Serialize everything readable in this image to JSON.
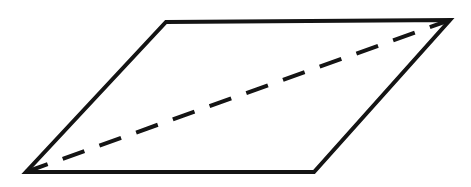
{
  "figure": {
    "type": "geometric-line-drawing",
    "canvas": {
      "width": 471,
      "height": 187,
      "background_color": "#ffffff"
    },
    "colors": {
      "stroke": "#141414",
      "fill": "#ffffff",
      "background": "#ffffff"
    },
    "shapes": {
      "plane": {
        "name": "parallelogram",
        "shape_kind": "polygon",
        "closed": true,
        "stroke_color": "#141414",
        "stroke_width": 4,
        "fill_color": "#ffffff",
        "vertices": [
          {
            "label": "top-left",
            "x": 166,
            "y": 22
          },
          {
            "label": "top-right",
            "x": 450,
            "y": 20
          },
          {
            "label": "bottom-right",
            "x": 314,
            "y": 172
          },
          {
            "label": "bottom-left",
            "x": 26,
            "y": 172
          }
        ],
        "points_attr": "166,22 450,20 314,172 26,172",
        "edges": [
          {
            "label": "top-edge",
            "from": "top-left",
            "to": "top-right"
          },
          {
            "label": "right-edge",
            "from": "top-right",
            "to": "bottom-right"
          },
          {
            "label": "bottom-edge",
            "from": "bottom-right",
            "to": "bottom-left"
          },
          {
            "label": "left-edge",
            "from": "bottom-left",
            "to": "top-left"
          }
        ]
      },
      "diagonal": {
        "name": "dashed-diagonal",
        "shape_kind": "line",
        "stroke_color": "#141414",
        "stroke_width": 4,
        "dash_length": 23,
        "gap_length": 16,
        "dash_array": "23 16",
        "from": {
          "label": "bottom-left",
          "x": 26,
          "y": 172
        },
        "to": {
          "label": "top-right",
          "x": 450,
          "y": 20
        },
        "x1": 26,
        "y1": 172,
        "x2": 450,
        "y2": 20
      }
    }
  }
}
